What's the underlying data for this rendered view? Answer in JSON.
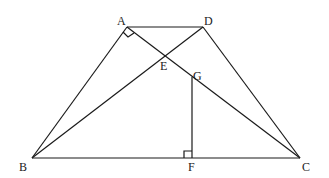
{
  "figure": {
    "points": {
      "A": {
        "label": "A"
      },
      "D": {
        "label": "D"
      },
      "B": {
        "label": "B"
      },
      "C": {
        "label": "C"
      },
      "E": {
        "label": "E"
      },
      "G": {
        "label": "G"
      },
      "F": {
        "label": "F"
      }
    },
    "segments": [
      "AD",
      "AB",
      "DC",
      "BC",
      "AC",
      "BD",
      "GF"
    ],
    "right_angles": [
      "BAC",
      "GFB"
    ]
  }
}
